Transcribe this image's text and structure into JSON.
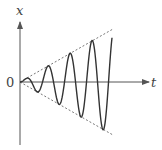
{
  "diagram": {
    "title": "",
    "axes": {
      "vertical_label": "x",
      "horizontal_label": "t",
      "origin_label": "0"
    },
    "colors": {
      "axis": "#555555",
      "curve": "#333333",
      "envelope": "#666666",
      "background": "#ffffff"
    }
  },
  "chart_data": {
    "type": "line",
    "title": "",
    "xlabel": "t",
    "ylabel": "x",
    "series": [
      {
        "name": "x(t) = k·t·sin(ωt)",
        "style": "solid",
        "peaks_t_px": [
          26,
          48,
          70,
          92
        ],
        "troughs_t_px": [
          37,
          58,
          80,
          105
        ],
        "cycles": 4
      },
      {
        "name": "upper envelope x = +k·t",
        "style": "dashed"
      },
      {
        "name": "lower envelope x = -k·t",
        "style": "dashed"
      }
    ],
    "grid": false,
    "legend": "none"
  }
}
